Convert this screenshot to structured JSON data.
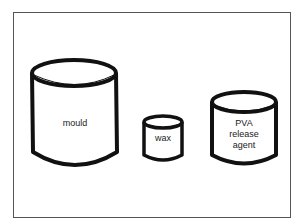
{
  "diagram": {
    "frame": {
      "stroke": "#555555"
    },
    "containers": [
      {
        "id": "mould",
        "label": "mould"
      },
      {
        "id": "wax",
        "label": "wax"
      },
      {
        "id": "pva",
        "label": "PVA\nrelease\nagent"
      }
    ],
    "colors": {
      "outline": "#111111",
      "fill": "#ffffff"
    }
  }
}
